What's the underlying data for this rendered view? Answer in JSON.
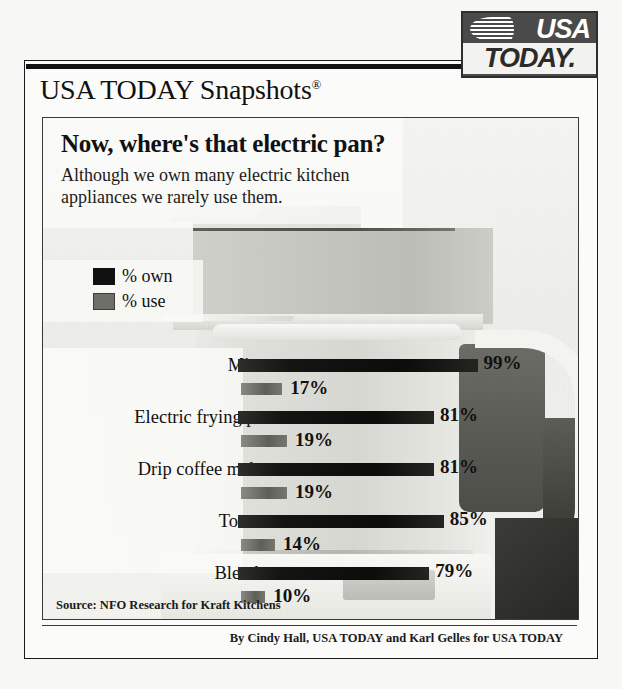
{
  "logo": {
    "top_text": "USA",
    "bottom_text": "TODAY.",
    "icon": "globe-swoosh-icon"
  },
  "header": {
    "title": "USA TODAY Snapshots",
    "registered_mark": "®"
  },
  "headline": "Now, where's that electric pan?",
  "deck": "Although we own many electric kitchen appliances we rarely use them.",
  "legend": {
    "items": [
      {
        "label": "% own",
        "color": "#111111",
        "key": "own"
      },
      {
        "label": "% use",
        "color": "#6f6f6a",
        "key": "use"
      }
    ]
  },
  "chart_data": {
    "type": "bar",
    "title": "Now, where's that electric pan?",
    "subtitle": "Although we own many electric kitchen appliances we rarely use them.",
    "orientation": "horizontal",
    "xlabel": "",
    "ylabel": "",
    "xlim": [
      0,
      100
    ],
    "grid": false,
    "legend_position": "top-left",
    "categories": [
      "Mixer",
      "Electric frying pan",
      "Drip coffee maker",
      "Toaster",
      "Blender"
    ],
    "series": [
      {
        "name": "% own",
        "color": "#111111",
        "values": [
          99,
          81,
          81,
          85,
          79
        ],
        "labels": [
          "99%",
          "81%",
          "81%",
          "85%",
          "79%"
        ]
      },
      {
        "name": "% use",
        "color": "#6f6f6a",
        "values": [
          17,
          19,
          19,
          14,
          10
        ],
        "labels": [
          "17%",
          "19%",
          "19%",
          "14%",
          "10%"
        ]
      }
    ]
  },
  "source": "Source: NFO Research for Kraft Kitchens",
  "credit": "By Cindy Hall, USA TODAY and Karl Gelles for USA TODAY",
  "photo": {
    "description": "drip-coffee-maker-photo"
  }
}
